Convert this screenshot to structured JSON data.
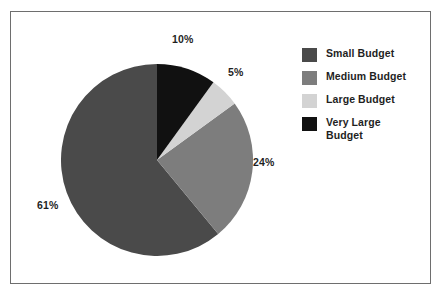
{
  "frame": {
    "border_color": "#6e6e6e",
    "background": "#ffffff"
  },
  "chart_data": {
    "type": "pie",
    "title": "",
    "subtitle": "",
    "xlabel": "",
    "ylabel": "",
    "legend_position": "right",
    "grid": false,
    "start_angle_deg": 0,
    "direction": "clockwise",
    "categories": [
      "Small Budget",
      "Medium Budget",
      "Large Budget",
      "Very Large Budget"
    ],
    "values": [
      61,
      24,
      5,
      10
    ],
    "labels": [
      "61%",
      "24%",
      "5%",
      "10%"
    ],
    "colors": [
      "#4a4a4a",
      "#7d7d7d",
      "#d3d3d3",
      "#111111"
    ],
    "slices": [
      {
        "name": "Very Large Budget",
        "value": 10,
        "label": "10%",
        "color": "#111111",
        "start_deg": 0,
        "end_deg": 36
      },
      {
        "name": "Large Budget",
        "value": 5,
        "label": "5%",
        "color": "#d3d3d3",
        "start_deg": 36,
        "end_deg": 54
      },
      {
        "name": "Medium Budget",
        "value": 24,
        "label": "24%",
        "color": "#7d7d7d",
        "start_deg": 54,
        "end_deg": 140.4
      },
      {
        "name": "Small Budget",
        "value": 61,
        "label": "61%",
        "color": "#4a4a4a",
        "start_deg": 140.4,
        "end_deg": 360
      }
    ]
  },
  "legend": {
    "items": [
      {
        "label": "Small Budget",
        "color": "#4a4a4a"
      },
      {
        "label": "Medium Budget",
        "color": "#7d7d7d"
      },
      {
        "label": "Large Budget",
        "color": "#d3d3d3"
      },
      {
        "label": "Very Large Budget",
        "color": "#111111"
      }
    ]
  }
}
